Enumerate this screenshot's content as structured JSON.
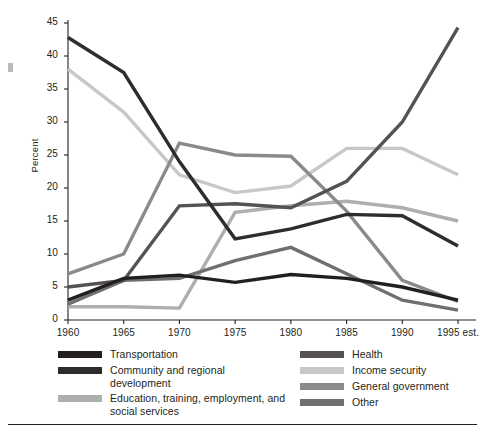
{
  "chart_data": {
    "type": "line",
    "title": "",
    "xlabel": "",
    "ylabel": "Percent",
    "ylim": [
      0,
      45
    ],
    "ytick_step": 5,
    "grid": false,
    "legend_position": "bottom",
    "categories": [
      "1960",
      "1965",
      "1970",
      "1975",
      "1980",
      "1985",
      "1990",
      "1995 est."
    ],
    "yticks": [
      "0",
      "5",
      "10",
      "15",
      "20",
      "25",
      "30",
      "35",
      "40",
      "45"
    ],
    "series": [
      {
        "name": "Transportation",
        "color": "#231f20",
        "values": [
          3.0,
          6.3,
          6.8,
          5.7,
          6.9,
          6.3,
          5.0,
          3.0
        ]
      },
      {
        "name": "Community and regional development",
        "color": "#2f2c2d",
        "values": [
          42.8,
          37.5,
          24.0,
          12.3,
          13.8,
          16.0,
          15.8,
          11.2
        ]
      },
      {
        "name": "Education, training, employment, and\nsocial services",
        "color": "#aeaeae",
        "values": [
          2.0,
          2.0,
          1.8,
          16.3,
          17.3,
          18.0,
          17.0,
          15.0
        ]
      },
      {
        "name": "Health",
        "color": "#565254",
        "values": [
          5.0,
          6.0,
          17.3,
          17.6,
          17.0,
          21.0,
          30.0,
          44.3
        ]
      },
      {
        "name": "Income security",
        "color": "#c8c8c8",
        "values": [
          38.0,
          31.5,
          22.0,
          19.3,
          20.3,
          26.0,
          26.0,
          22.0
        ]
      },
      {
        "name": "General government",
        "color": "#8a8a8a",
        "values": [
          7.0,
          10.0,
          26.8,
          25.0,
          24.8,
          16.5,
          6.0,
          2.8
        ]
      },
      {
        "name": "Other",
        "color": "#6f6f6f",
        "values": [
          2.4,
          6.0,
          6.3,
          9.0,
          11.0,
          7.0,
          3.0,
          1.5
        ]
      }
    ]
  },
  "legend": {
    "left_items": [
      {
        "label": "Transportation",
        "color": "#231f20"
      },
      {
        "label": "Community and regional development",
        "color": "#2f2c2d"
      },
      {
        "label": "Education, training, employment, and\nsocial services",
        "color": "#aeaeae"
      }
    ],
    "right_items": [
      {
        "label": "Health",
        "color": "#565254"
      },
      {
        "label": "Income security",
        "color": "#c8c8c8"
      },
      {
        "label": "General government",
        "color": "#8a8a8a"
      },
      {
        "label": "Other",
        "color": "#6f6f6f"
      }
    ]
  }
}
